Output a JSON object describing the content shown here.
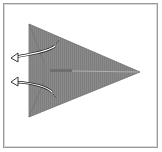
{
  "diagram": {
    "type": "origami-step",
    "frame": {
      "border_color": "#9a9a9a"
    },
    "paper": {
      "shape": "triangle-pointing-right",
      "fill": "#8a8a8a",
      "stripe": "#7c7c7c",
      "edge": "#6f6f6f",
      "vertices": {
        "top_left": [
          29,
          24
        ],
        "bottom_left": [
          29,
          117
        ],
        "tip": [
          140,
          72
        ]
      }
    },
    "center_crease": {
      "color": "#a8a8a8",
      "accent": "#6a6a6a"
    },
    "arrows": [
      {
        "id": "upper",
        "direction": "left",
        "label": "unfold-flap-upper"
      },
      {
        "id": "lower",
        "direction": "left",
        "label": "unfold-flap-lower"
      }
    ]
  }
}
